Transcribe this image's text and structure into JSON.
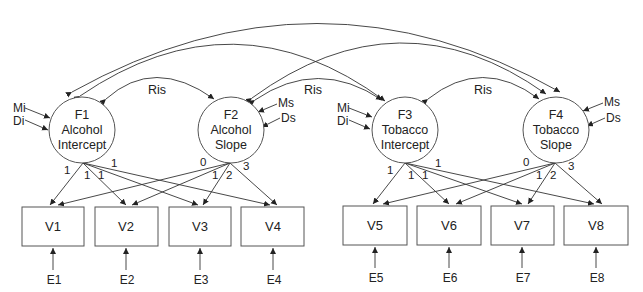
{
  "factors": [
    {
      "id": "F1",
      "lines": [
        "F1",
        "Alcohol",
        "Intercept"
      ],
      "cx": 82,
      "cy": 130,
      "r": 33
    },
    {
      "id": "F2",
      "lines": [
        "F2",
        "Alcohol",
        "Slope"
      ],
      "cx": 231,
      "cy": 130,
      "r": 33
    },
    {
      "id": "F3",
      "lines": [
        "F3",
        "Tobacco",
        "Intercept"
      ],
      "cx": 405,
      "cy": 130,
      "r": 33
    },
    {
      "id": "F4",
      "lines": [
        "F4",
        "Tobacco",
        "Slope"
      ],
      "cx": 556,
      "cy": 130,
      "r": 33
    }
  ],
  "observed": [
    {
      "id": "V1",
      "label": "V1",
      "x": 22,
      "y": 207,
      "w": 62,
      "h": 39
    },
    {
      "id": "V2",
      "label": "V2",
      "x": 95,
      "y": 207,
      "w": 63,
      "h": 39
    },
    {
      "id": "V3",
      "label": "V3",
      "x": 169,
      "y": 207,
      "w": 62,
      "h": 39
    },
    {
      "id": "V4",
      "label": "V4",
      "x": 241,
      "y": 207,
      "w": 63,
      "h": 39
    },
    {
      "id": "V5",
      "label": "V5",
      "x": 343,
      "y": 206,
      "w": 64,
      "h": 39
    },
    {
      "id": "V6",
      "label": "V6",
      "x": 417,
      "y": 206,
      "w": 64,
      "h": 39
    },
    {
      "id": "V7",
      "label": "V7",
      "x": 491,
      "y": 206,
      "w": 63,
      "h": 39
    },
    {
      "id": "V8",
      "label": "V8",
      "x": 564,
      "y": 206,
      "w": 64,
      "h": 39
    }
  ],
  "errors": [
    "E1",
    "E2",
    "E3",
    "E4",
    "E5",
    "E6",
    "E7",
    "E8"
  ],
  "covariates": {
    "intercept": [
      "Mi",
      "Di"
    ],
    "slope": [
      "Ms",
      "Ds"
    ]
  },
  "covariances": [
    {
      "from": "F1",
      "to": "F2",
      "label": "Ris"
    },
    {
      "from": "F2",
      "to": "F3",
      "label": "Ris"
    },
    {
      "from": "F3",
      "to": "F4",
      "label": "Ris"
    },
    {
      "from": "F1",
      "to": "F3",
      "label": ""
    },
    {
      "from": "F2",
      "to": "F4",
      "label": ""
    },
    {
      "from": "F1",
      "to": "F4",
      "label": ""
    }
  ],
  "loadings": {
    "intercept": [
      "1",
      "1",
      "1",
      "1"
    ],
    "slope": [
      "0",
      "1",
      "2",
      "3"
    ]
  }
}
